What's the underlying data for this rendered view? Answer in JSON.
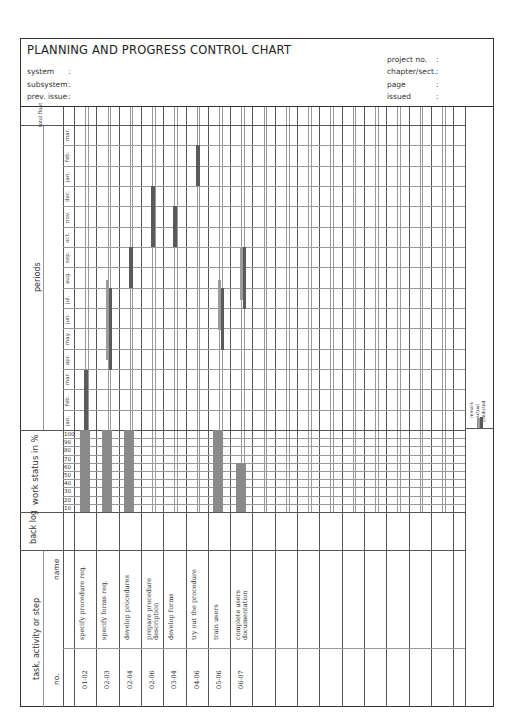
{
  "header": {
    "title": "PLANNING AND PROGRESS CONTROL CHART",
    "left_fields": [
      {
        "label": "system",
        "sep": ":",
        "value": ""
      },
      {
        "label": "subsystem",
        "sep": ":",
        "value": ""
      },
      {
        "label": "prev. issue",
        "sep": ":",
        "value": ""
      }
    ],
    "right_fields": [
      {
        "label": "project no.",
        "sep": ":",
        "value": ""
      },
      {
        "label": "chapter/sect.",
        "sep": ":",
        "value": ""
      },
      {
        "label": "page",
        "sep": ":",
        "value": ""
      },
      {
        "label": "issued",
        "sep": ":",
        "value": ""
      }
    ]
  },
  "sections": {
    "total_float": "total float",
    "periods": "periods",
    "work_status": "work status in %",
    "backlog": "back log",
    "task_group": "task, activity or step",
    "name_col": "name",
    "no_col": "no."
  },
  "months": [
    "mar.",
    "feb.",
    "jan.",
    "dec.",
    "nov.",
    "oct.",
    "sep.",
    "aug.",
    "jul.",
    "jun.",
    "may",
    "apr.",
    "mar.",
    "feb.",
    "jan."
  ],
  "percent_ticks": [
    "100",
    "90",
    "80",
    "70",
    "60",
    "50",
    "40",
    "30",
    "20",
    "10"
  ],
  "legend": {
    "remark": "remark",
    "actual": "actual",
    "predicted": "predicted",
    "actual_color": "#9a9a9a",
    "predicted_color": "#5a5a5a"
  },
  "tasks": [
    {
      "no": "01-02",
      "name": "specify procedure req.",
      "status_pct": 100
    },
    {
      "no": "02-03",
      "name": "specify forms req.",
      "status_pct": 100
    },
    {
      "no": "02-04",
      "name": "develop procedures",
      "status_pct": 100
    },
    {
      "no": "02-06",
      "name": "prepare procedure description",
      "status_pct": 0
    },
    {
      "no": "03-04",
      "name": "develop forms",
      "status_pct": 0
    },
    {
      "no": "04-06",
      "name": "try out the procedure",
      "status_pct": 0
    },
    {
      "no": "05-06",
      "name": "train users",
      "status_pct": 100
    },
    {
      "no": "06-07",
      "name": "complete users documentation",
      "status_pct": 60
    }
  ],
  "chart_data": {
    "type": "gantt",
    "title": "PLANNING AND PROGRESS CONTROL CHART",
    "periods": [
      "jan.",
      "feb.",
      "mar.",
      "apr.",
      "may",
      "jun.",
      "jul.",
      "aug.",
      "sep.",
      "oct.",
      "nov.",
      "dec.",
      "jan.",
      "feb.",
      "mar."
    ],
    "series": [
      {
        "task": "01-02 specify procedure req.",
        "predicted": [
          "jan.",
          "mar."
        ],
        "actual": [
          "jan.",
          "mar."
        ],
        "work_status_pct": 100
      },
      {
        "task": "02-03 specify forms req.",
        "predicted": [
          "apr.",
          "jul."
        ],
        "actual": [
          "apr.",
          "aug."
        ],
        "work_status_pct": 100
      },
      {
        "task": "02-04 develop procedures",
        "predicted": [
          "aug.",
          "sep."
        ],
        "actual": null,
        "work_status_pct": 100
      },
      {
        "task": "02-06 prepare procedure description",
        "predicted": [
          "oct.",
          "dec."
        ],
        "actual": null,
        "work_status_pct": 0
      },
      {
        "task": "03-04 develop forms",
        "predicted": [
          "oct.",
          "nov."
        ],
        "actual": null,
        "work_status_pct": 0
      },
      {
        "task": "04-06 try out the procedure",
        "predicted": [
          "jan.",
          "feb."
        ],
        "actual": null,
        "work_status_pct": 0
      },
      {
        "task": "05-06 train users",
        "predicted": [
          "apr.",
          "jun."
        ],
        "actual": [
          "may",
          "jul."
        ],
        "work_status_pct": 100
      },
      {
        "task": "06-07 complete users documentation",
        "predicted": [
          "aug.",
          "sep."
        ],
        "actual": [
          "jul.",
          "sep."
        ],
        "work_status_pct": 60
      }
    ]
  }
}
